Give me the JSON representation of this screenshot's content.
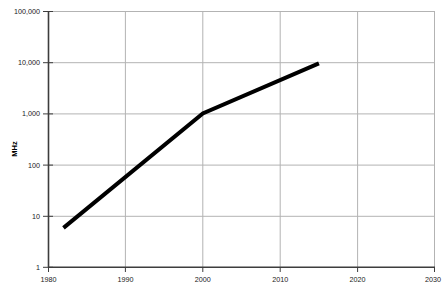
{
  "chart_data": {
    "type": "line",
    "title": "",
    "subtitle": "",
    "xlabel": "",
    "ylabel": "MHz",
    "xlim": [
      1980,
      2030
    ],
    "ylim": [
      1,
      100000
    ],
    "yscale": "log",
    "xscale": "linear",
    "grid": true,
    "legend": "none",
    "xticks": [
      1980,
      1990,
      2000,
      2010,
      2020,
      2030
    ],
    "xticklabels": [
      "1980",
      "1990",
      "2000",
      "2010",
      "2020",
      "2030"
    ],
    "yticks": [
      1,
      10,
      100,
      1000,
      10000,
      100000
    ],
    "yticklabels": [
      "1",
      "10",
      "100",
      "1,000",
      "10,000",
      "100,000"
    ],
    "series": [
      {
        "name": "CPU clock frequency",
        "color": "#000000",
        "linewidth": 4,
        "x": [
          1982,
          2000,
          2015
        ],
        "y": [
          5.8,
          1000,
          9500
        ]
      }
    ],
    "colors": {
      "line": "#000000",
      "grid": "#b3b3b3",
      "axis": "#404040",
      "background": "#ffffff",
      "text": "#1a1a1a"
    },
    "plot_box_px": {
      "left": 48,
      "right": 435,
      "top": 11,
      "bottom": 267
    }
  }
}
